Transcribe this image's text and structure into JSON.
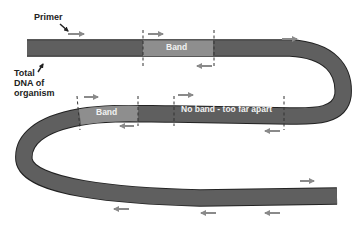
{
  "labels": {
    "primer": "Primer",
    "total_dna_line1": "Total",
    "total_dna_line2": "DNA of",
    "total_dna_line3": "organism"
  },
  "bands": {
    "top_band": "Band",
    "middle_band": "Band",
    "no_band": "No band - too far apart"
  },
  "colors": {
    "strand": "#5f5f5f",
    "band": "#8e8e8e",
    "arrow": "#8a8a8a",
    "dashed_line": "#333333",
    "text_dark": "#222222",
    "text_light": "#f2f2f2"
  },
  "icons": {
    "forward_primer": "right-arrow",
    "reverse_primer": "left-arrow",
    "pointer": "diagonal-arrow"
  }
}
